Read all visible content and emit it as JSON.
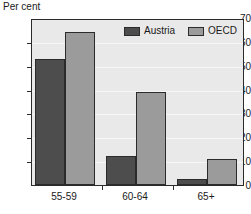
{
  "chart_data": {
    "type": "bar",
    "title": "",
    "xlabel": "",
    "ylabel": "Per cent",
    "categories": [
      "55-59",
      "60-64",
      "65+"
    ],
    "series": [
      {
        "name": "Austria",
        "color": "#4d4d4d",
        "values": [
          53,
          12,
          2.5
        ]
      },
      {
        "name": "OECD",
        "color": "#9b9b9b",
        "values": [
          64,
          39,
          11
        ]
      }
    ],
    "ylim": [
      0,
      70
    ],
    "yticks": [
      0,
      10,
      20,
      30,
      40,
      50,
      60,
      70
    ],
    "ytick_labels": [
      "0",
      "10",
      "20",
      "30",
      "40",
      "50",
      "60",
      "70"
    ],
    "grid": true,
    "legend_position": "top-right",
    "plot_background": "#e9e9e9",
    "axis_color": "#2b2b2b"
  }
}
